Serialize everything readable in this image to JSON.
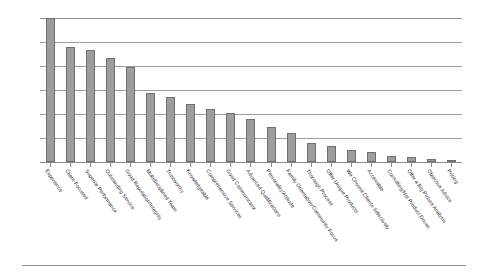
{
  "chart_data": {
    "type": "bar",
    "title": "",
    "subtitle": "",
    "xlabel": "",
    "ylabel": "",
    "grid": true,
    "legend": false,
    "legend_position": "none",
    "orientation": "vertical",
    "sorted": "descending",
    "ylim": [
      0,
      100
    ],
    "gridline_count": 7,
    "gridline_values": [
      100,
      83.3,
      66.7,
      50,
      33.3,
      16.7,
      0
    ],
    "axis_tick_labels_visible": false,
    "bar_color": "#9d9d9d",
    "bar_border_color": "#6f6f6f",
    "gridline_color": "#9c9c9c",
    "label_rotation_degrees": 55,
    "categories": [
      "Experience",
      "Client-Focused",
      "Superior Performance",
      "Outstanding Service",
      "Good Reputation/Integrity",
      "Multidisciplined Team",
      "Trustworthy",
      "Knowledgeable",
      "Comprehensive Services",
      "Good Communicator",
      "Advanced Qualifications",
      "Personality/Attitude",
      "Family Orientation/Community Focus",
      "Thorough Process",
      "Offer Unique Products",
      "We Choose Clients Selectively",
      "Accessible",
      "Consulting/Not Product Driven",
      "Offer a Big Picture Analysis",
      "Objective Advice",
      "Pricing"
    ],
    "values": [
      100,
      80,
      78,
      72,
      66,
      48,
      45,
      40,
      37,
      34,
      30,
      24,
      20,
      13,
      11,
      8,
      7,
      4,
      3.5,
      2,
      1.5
    ]
  }
}
